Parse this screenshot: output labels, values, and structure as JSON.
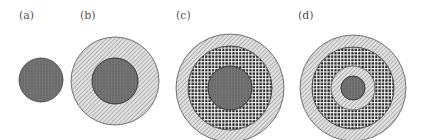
{
  "figure": {
    "panels": [
      {
        "label": "(a)",
        "description": "solid core only"
      },
      {
        "label": "(b)",
        "description": "core surrounded by diagonal-hatched shell"
      },
      {
        "label": "(c)",
        "description": "core, cross-hatched grid layer, diagonal-hatched outer shell"
      },
      {
        "label": "(d)",
        "description": "small core, diagonal-hatched ring, grid layer, diagonal-hatched outer shell"
      }
    ]
  },
  "colors": {
    "core": "#6e6e6e",
    "core_grid": "#8a8a8a",
    "hatch_bg": "#d8d8d8",
    "hatch_line": "#7a7a7a",
    "grid_bg": "#2a2a2a",
    "grid_line": "#ffffff",
    "outline": "#3a3a3a"
  }
}
